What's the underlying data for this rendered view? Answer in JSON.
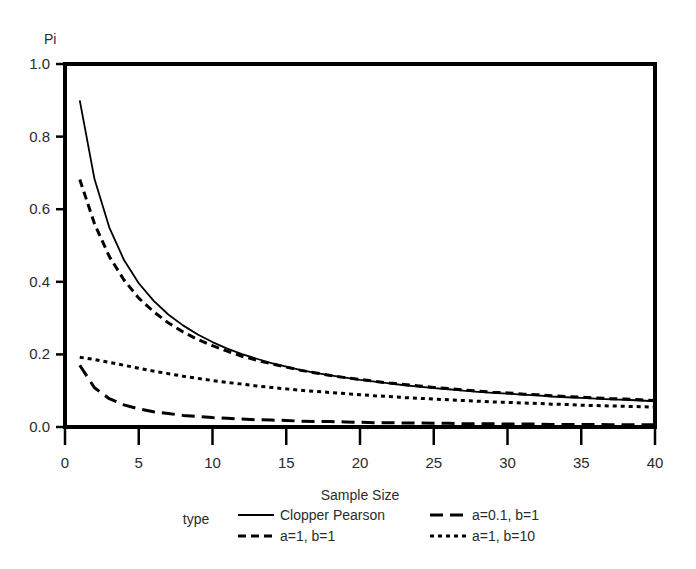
{
  "chart_data": {
    "type": "line",
    "title": "",
    "xlabel": "Sample Size",
    "ylabel": "Pi",
    "xlim": [
      0,
      40
    ],
    "ylim": [
      0,
      1.0
    ],
    "grid": false,
    "legend_position": "bottom",
    "legend_title": "type",
    "xticks": [
      0,
      5,
      10,
      15,
      20,
      25,
      30,
      35,
      40
    ],
    "xtick_labels": [
      "0",
      "5",
      "10",
      "15",
      "20",
      "25",
      "30",
      "35",
      "40"
    ],
    "yticks": [
      0.0,
      0.2,
      0.4,
      0.6,
      0.8,
      1.0
    ],
    "ytick_labels": [
      "0.0",
      "0.2",
      "0.4",
      "0.6",
      "0.8",
      "1.0"
    ],
    "x": [
      1,
      2,
      3,
      4,
      5,
      6,
      7,
      8,
      9,
      10,
      11,
      12,
      13,
      14,
      15,
      16,
      17,
      18,
      19,
      20,
      21,
      22,
      23,
      24,
      25,
      26,
      27,
      28,
      29,
      30,
      31,
      32,
      33,
      34,
      35,
      36,
      37,
      38,
      39,
      40
    ],
    "series": [
      {
        "name": "Clopper Pearson",
        "dash": "solid",
        "color": "#000000",
        "values": [
          0.9,
          0.683,
          0.55,
          0.46,
          0.396,
          0.348,
          0.31,
          0.28,
          0.255,
          0.234,
          0.216,
          0.201,
          0.188,
          0.176,
          0.166,
          0.157,
          0.149,
          0.142,
          0.136,
          0.13,
          0.125,
          0.12,
          0.115,
          0.111,
          0.107,
          0.104,
          0.1,
          0.097,
          0.094,
          0.092,
          0.089,
          0.087,
          0.084,
          0.082,
          0.08,
          0.078,
          0.076,
          0.075,
          0.073,
          0.071
        ]
      },
      {
        "name": "a=0.1, b=1",
        "dash": "long-dash",
        "color": "#000000",
        "values": [
          0.17,
          0.108,
          0.078,
          0.061,
          0.05,
          0.042,
          0.037,
          0.032,
          0.029,
          0.026,
          0.024,
          0.022,
          0.02,
          0.019,
          0.018,
          0.016,
          0.015,
          0.015,
          0.014,
          0.013,
          0.012,
          0.012,
          0.011,
          0.011,
          0.01,
          0.01,
          0.009,
          0.009,
          0.009,
          0.008,
          0.008,
          0.008,
          0.007,
          0.007,
          0.007,
          0.007,
          0.006,
          0.006,
          0.006,
          0.006
        ]
      },
      {
        "name": "a=1, b=1",
        "dash": "medium-dash",
        "color": "#000000",
        "values": [
          0.682,
          0.56,
          0.47,
          0.405,
          0.355,
          0.318,
          0.287,
          0.262,
          0.241,
          0.224,
          0.209,
          0.195,
          0.184,
          0.174,
          0.165,
          0.156,
          0.149,
          0.142,
          0.136,
          0.131,
          0.126,
          0.121,
          0.117,
          0.113,
          0.109,
          0.106,
          0.102,
          0.099,
          0.096,
          0.094,
          0.091,
          0.089,
          0.086,
          0.084,
          0.082,
          0.08,
          0.078,
          0.077,
          0.075,
          0.073
        ]
      },
      {
        "name": "a=1, b=10",
        "dash": "dotted",
        "color": "#000000",
        "values": [
          0.192,
          0.186,
          0.178,
          0.17,
          0.162,
          0.154,
          0.147,
          0.14,
          0.134,
          0.128,
          0.123,
          0.118,
          0.113,
          0.109,
          0.105,
          0.101,
          0.098,
          0.095,
          0.092,
          0.089,
          0.086,
          0.084,
          0.081,
          0.079,
          0.077,
          0.075,
          0.073,
          0.071,
          0.069,
          0.068,
          0.066,
          0.065,
          0.063,
          0.062,
          0.06,
          0.059,
          0.058,
          0.057,
          0.056,
          0.055
        ]
      }
    ]
  },
  "axis": {
    "y_label": "Pi",
    "x_label": "Sample Size"
  },
  "legend": {
    "title": "type",
    "entries": [
      {
        "label": "Clopper Pearson",
        "dash": "solid"
      },
      {
        "label": "a=0.1, b=1",
        "dash": "long-dash"
      },
      {
        "label": "a=1, b=1",
        "dash": "medium-dash"
      },
      {
        "label": "a=1, b=10",
        "dash": "dotted"
      }
    ]
  }
}
